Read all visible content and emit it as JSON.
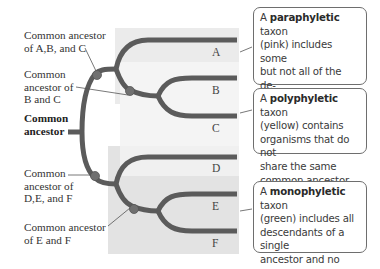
{
  "diagram": {
    "type": "phylogenetic-tree",
    "taxa": [
      "A",
      "B",
      "C",
      "D",
      "E",
      "F"
    ],
    "node_labels": {
      "abc": [
        "Common ancestor",
        "of A,B, and C"
      ],
      "bc": [
        "Common",
        "ancestor of",
        "B and C"
      ],
      "root": [
        "Common",
        "ancestor"
      ],
      "def": [
        "Common",
        "ancestor of",
        "D,E, and F"
      ],
      "ef": [
        "Common ancestor",
        "of E and F"
      ]
    },
    "callouts": {
      "paraphyletic": {
        "prefix": "A ",
        "term": "paraphyletic",
        "rest_first": " taxon",
        "lines": [
          "(pink) includes some",
          "but not all of the de-",
          "scendants of a single",
          "ancestor."
        ]
      },
      "polyphyletic": {
        "prefix": "A ",
        "term": "polyphyletic",
        "rest_first": " taxon",
        "lines": [
          "(yellow) contains",
          "organisms that do not",
          "share the same",
          "common ancestor."
        ]
      },
      "monophyletic": {
        "prefix": "A ",
        "term": "monophyletic",
        "rest_first": " taxon",
        "lines": [
          "(green) includes all",
          "descendants of a single",
          "ancestor and no other",
          "organism."
        ]
      }
    },
    "colors": {
      "branch": "#5a5a5a",
      "node": "#6a6a6a",
      "para_shade": "#e9e9e9",
      "poly_shade": "#f3f3f3",
      "mono_shade": "#dedede"
    }
  }
}
